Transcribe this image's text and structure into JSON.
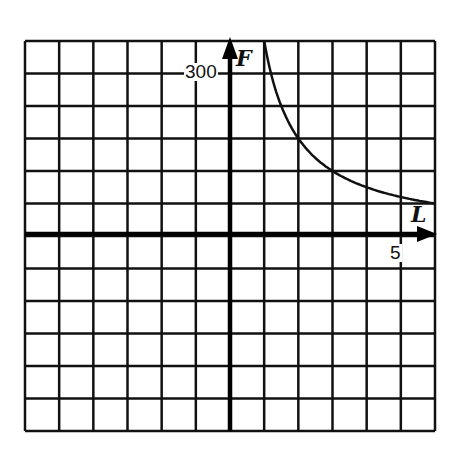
{
  "chart_data": {
    "type": "line",
    "title": "",
    "xlabel": "L",
    "ylabel": "F",
    "grid": true,
    "x_grid_step": 1,
    "y_grid_step": 60,
    "xlim": [
      -6,
      6
    ],
    "ylim": [
      -360,
      360
    ],
    "tick_labels": {
      "x": [
        {
          "value": 5,
          "label": "5"
        }
      ],
      "y": [
        {
          "value": 300,
          "label": "300"
        }
      ]
    },
    "series": [
      {
        "name": "F vs L",
        "relation": "F = 360 / L",
        "x": [
          1,
          1.5,
          2,
          2.5,
          3,
          3.5,
          4,
          4.5,
          5,
          5.5,
          6
        ],
        "y": [
          360,
          240,
          180,
          144,
          120,
          103,
          90,
          80,
          72,
          65,
          60
        ]
      }
    ],
    "colors": {
      "grid": "#111111",
      "axis": "#000000",
      "curve": "#111111",
      "background": "#ffffff"
    }
  },
  "labels": {
    "y_axis_name": "F",
    "x_axis_name": "L",
    "y_tick": "300",
    "x_tick": "5"
  }
}
